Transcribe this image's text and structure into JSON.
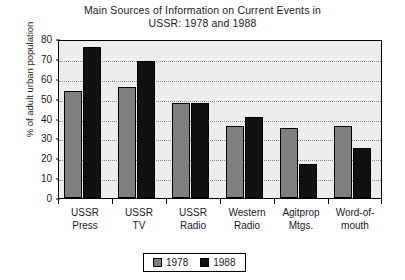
{
  "chart_data": {
    "type": "bar",
    "title": "Main Sources of Information on Current Events in USSR: 1978 and 1988",
    "title_line1": "Main Sources of Information on Current Events in",
    "title_line2": "USSR: 1978 and 1988",
    "xlabel": "",
    "ylabel": "% of adult urban population",
    "ylim": [
      0,
      80
    ],
    "ytick_step": 10,
    "ytick_labels": [
      "80",
      "70",
      "60",
      "50",
      "40",
      "30",
      "20",
      "10",
      "0"
    ],
    "ytick_values": [
      80,
      70,
      60,
      50,
      40,
      30,
      20,
      10,
      0
    ],
    "grid": true,
    "legend_position": "bottom-center",
    "categories": [
      "USSR Press",
      "USSR TV",
      "USSR Radio",
      "Western Radio",
      "Agitprop Mtgs.",
      "Word-of-mouth"
    ],
    "category_lines": [
      [
        "USSR",
        "Press"
      ],
      [
        "USSR",
        "TV"
      ],
      [
        "USSR",
        "Radio"
      ],
      [
        "Western",
        "Radio"
      ],
      [
        "Agitprop",
        "Mtgs."
      ],
      [
        "Word-of-",
        "mouth"
      ]
    ],
    "series": [
      {
        "name": "1978",
        "color": "#808080",
        "values": [
          54,
          56,
          48,
          36,
          35,
          36
        ]
      },
      {
        "name": "1988",
        "color": "#111111",
        "values": [
          76,
          69,
          48,
          41,
          17,
          25
        ]
      }
    ]
  },
  "legend": {
    "items": [
      {
        "label": "1978",
        "color": "#808080"
      },
      {
        "label": "1988",
        "color": "#111111"
      }
    ]
  },
  "colors": {
    "series_1978": "#808080",
    "series_1988": "#111111",
    "plot_background": "#ededed",
    "page_background": "#ffffff",
    "axis": "#000000",
    "gridline": "#8c8c8c",
    "text": "#1a1a1a"
  }
}
